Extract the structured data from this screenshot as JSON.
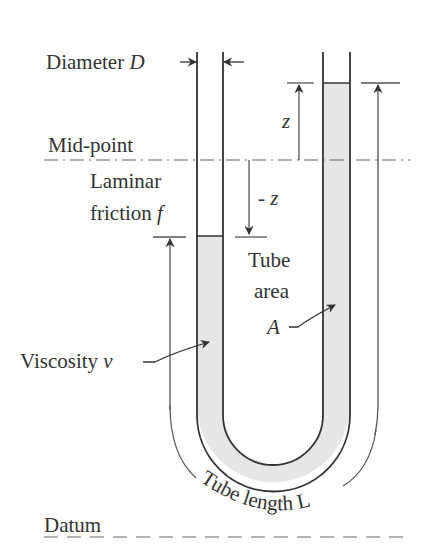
{
  "diagram": {
    "labels": {
      "diameter": "Diameter ",
      "diameter_symbol": "D",
      "mid_point": "Mid-point",
      "laminar": "Laminar",
      "friction": "friction ",
      "friction_symbol": "f",
      "z_pos": "z",
      "z_neg": "- z",
      "tube": "Tube",
      "area": "area",
      "area_symbol": "A",
      "viscosity": "Viscosity ",
      "viscosity_symbol": "ν",
      "tube_length": "Tube length L",
      "datum": "Datum"
    },
    "colors": {
      "line": "#333333",
      "fluid_fill": "#e6e6e6",
      "guide_line": "#666666"
    }
  }
}
